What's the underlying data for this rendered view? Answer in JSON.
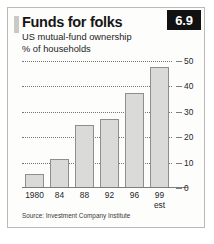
{
  "figure": {
    "badge": "6.9",
    "title": "Funds for folks",
    "subtitle_1": "US mutual-fund ownership",
    "subtitle_2": "% of households",
    "source": "Source: Investment Company Institute"
  },
  "chart_data": {
    "type": "bar",
    "title": "Funds for folks",
    "subtitle": "US mutual-fund ownership",
    "xlabel": "",
    "ylabel": "% of households",
    "ylim": [
      0,
      50
    ],
    "yticks": [
      0,
      10,
      20,
      30,
      40,
      50
    ],
    "ytick_labels": [
      "0",
      "10",
      "20",
      "30",
      "40",
      "50"
    ],
    "grid": true,
    "legend": false,
    "categories": [
      "1980",
      "84",
      "88",
      "92",
      "96",
      "99"
    ],
    "category_sublabels": [
      "",
      "",
      "",
      "",
      "",
      "est"
    ],
    "values": [
      5.5,
      11.5,
      25,
      27,
      37.5,
      47.5
    ],
    "source": "Source: Investment Company Institute",
    "colors": {
      "bar_fill": "#dadad8",
      "bar_edge": "#8e8e8e",
      "badge_bg": "#111111",
      "badge_text": "#ffffff",
      "grid": "#767676",
      "axis": "#7d7d7d"
    }
  }
}
